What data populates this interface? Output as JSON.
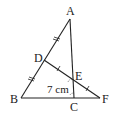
{
  "diagram": {
    "type": "geometry-figure",
    "points": {
      "A": {
        "label": "A",
        "x": 70,
        "y": 19
      },
      "B": {
        "label": "B",
        "x": 21,
        "y": 98
      },
      "C": {
        "label": "C",
        "x": 74,
        "y": 98
      },
      "D": {
        "label": "D",
        "x": 44,
        "y": 60
      },
      "E": {
        "label": "E",
        "x": 73,
        "y": 79
      },
      "F": {
        "label": "F",
        "x": 100,
        "y": 98
      }
    },
    "segments": [
      [
        "A",
        "B"
      ],
      [
        "A",
        "C"
      ],
      [
        "B",
        "F"
      ],
      [
        "D",
        "F"
      ]
    ],
    "equal_marks": {
      "double_tick": [
        "AD",
        "DB"
      ],
      "single_tick": [
        "DE",
        "EF"
      ]
    },
    "length_label": {
      "text": "7 cm",
      "refers_to": "BC"
    },
    "stroke_color": "#222222"
  }
}
